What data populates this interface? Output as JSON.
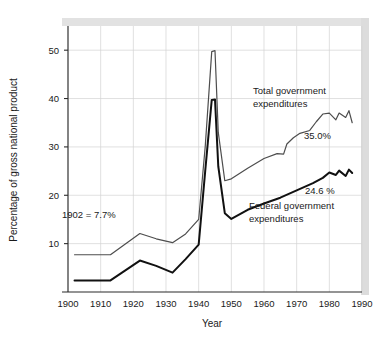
{
  "chart_data": {
    "type": "line",
    "title": "",
    "xlabel": "Year",
    "ylabel": "Percentage of gross national product",
    "xlim": [
      1900,
      1990
    ],
    "ylim": [
      0,
      55
    ],
    "xticks": [
      1900,
      1910,
      1920,
      1930,
      1940,
      1950,
      1960,
      1970,
      1980,
      1990
    ],
    "yticks": [
      10,
      20,
      30,
      40,
      50
    ],
    "grid": true,
    "legend_position": "inline-annotations",
    "series": [
      {
        "name": "Total government expenditures",
        "color": "#4d4d4d",
        "line_width": 1.2,
        "end_label": "35.0%",
        "label_line_1": "Total government",
        "label_line_2": "expenditures",
        "x": [
          1902,
          1913,
          1922,
          1927,
          1932,
          1936,
          1940,
          1942,
          1944,
          1945,
          1946,
          1948,
          1950,
          1955,
          1960,
          1964,
          1966,
          1967,
          1969,
          1971,
          1974,
          1976,
          1978,
          1980,
          1982,
          1983,
          1985,
          1986,
          1987
        ],
        "y": [
          7.7,
          7.7,
          12.1,
          11.0,
          10.2,
          12.0,
          15.0,
          30.0,
          49.7,
          49.9,
          33.0,
          23.0,
          23.4,
          25.6,
          27.6,
          28.6,
          28.5,
          30.6,
          31.9,
          32.8,
          33.4,
          35.2,
          36.8,
          37.0,
          35.6,
          37.0,
          36.1,
          37.5,
          35.0
        ]
      },
      {
        "name": "Federal government expenditures",
        "color": "#111111",
        "line_width": 2.0,
        "end_label": "24.6 %",
        "label_line_1": "Federal government",
        "label_line_2": "expenditures",
        "x": [
          1902,
          1913,
          1922,
          1927,
          1932,
          1936,
          1940,
          1942,
          1944,
          1945,
          1946,
          1948,
          1950,
          1955,
          1960,
          1965,
          1970,
          1975,
          1978,
          1980,
          1982,
          1983,
          1985,
          1986,
          1987
        ],
        "y": [
          2.4,
          2.4,
          6.5,
          5.4,
          4.0,
          6.8,
          9.8,
          25.0,
          39.7,
          39.8,
          26.0,
          16.3,
          15.1,
          17.0,
          18.3,
          19.5,
          21.0,
          22.5,
          23.6,
          24.7,
          24.2,
          25.1,
          24.0,
          25.3,
          24.6
        ]
      }
    ],
    "annotations": [
      {
        "name": "start-value-note",
        "text": "1902  =  7.7%",
        "x_px": 62,
        "y_px": 215
      }
    ]
  },
  "labels": {
    "y_axis_title": "Percentage of gross national product",
    "x_axis_title": "Year",
    "start_note": "1902  =  7.7%",
    "total_label_line1": "Total government",
    "total_label_line2": "expenditures",
    "total_end_value": "35.0%",
    "federal_label_line1": "Federal government",
    "federal_label_line2": "expenditures",
    "federal_end_value": "24.6 %"
  },
  "ticks": {
    "y": [
      "50",
      "40",
      "30",
      "20",
      "10"
    ],
    "x": [
      "1900",
      "1910",
      "1920",
      "1930",
      "1940",
      "1950",
      "1960",
      "1970",
      "1980",
      "1990"
    ]
  },
  "colors": {
    "total_series": "#4d4d4d",
    "federal_series": "#111111",
    "gridline": "#d2d2d2",
    "axis": "#2b2b2b",
    "text": "#1a1a1a",
    "shadow": "#e2e2e2",
    "background": "#ffffff"
  }
}
